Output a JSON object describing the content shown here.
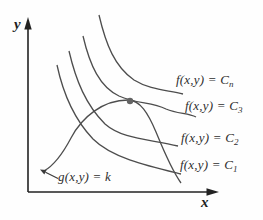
{
  "figure": {
    "axes": {
      "x_label": "x",
      "y_label": "y"
    },
    "level_curve_labels": [
      {
        "text": "f(x,y) = C",
        "sub": "n"
      },
      {
        "text": "f(x,y) = C",
        "sub": "3"
      },
      {
        "text": "f(x,y) = C",
        "sub": "2"
      },
      {
        "text": "f(x,y) = C",
        "sub": "1"
      }
    ],
    "constraint_label": {
      "text": "g(x,y) = k"
    },
    "tangent_point": {
      "x": 130,
      "y": 101
    },
    "colors": {
      "curve": "#4d4d4d",
      "axis": "#222222",
      "text": "#2e2e2e",
      "dot": "#636363",
      "background": "#fefefe"
    }
  }
}
